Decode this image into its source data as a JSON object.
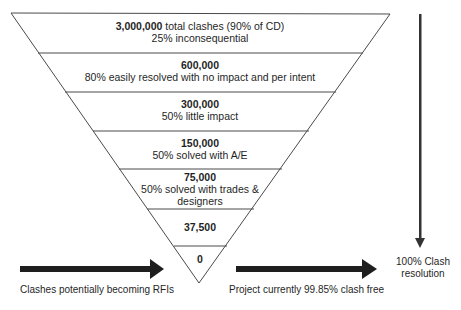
{
  "funnel": {
    "levels": [
      {
        "value": "3,000,000",
        "text": "total clashes (90% of CD)",
        "note": "25% inconsequential"
      },
      {
        "value": "600,000",
        "note": "80% easily resolved with no impact and per intent"
      },
      {
        "value": "300,000",
        "note": "50% little impact"
      },
      {
        "value": "150,000",
        "note": "50% solved with A/E"
      },
      {
        "value": "75,000",
        "note": "50% solved with trades & designers"
      },
      {
        "value": "37,500"
      },
      {
        "value": "0"
      }
    ]
  },
  "arrows": {
    "left_label": "Clashes potentially becoming RFIs",
    "right_label": "Project currently 99.85% clash free",
    "vertical_label_line1": "100% Clash",
    "vertical_label_line2": "resolution"
  },
  "colors": {
    "line": "#4a4a4a",
    "arrow": "#1e1e1e",
    "text": "#1f1f1f"
  }
}
